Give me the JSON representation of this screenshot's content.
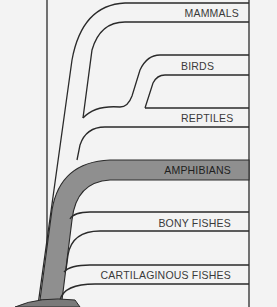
{
  "diagram": {
    "title": "",
    "type": "evolutionary-tree",
    "colors": {
      "background": "#f3f3f3",
      "line": "#2a2a2a",
      "highlight": "#8f8f8f",
      "text": "#3a3a3a"
    },
    "groups": [
      {
        "id": "mammals",
        "label": "MAMMALS"
      },
      {
        "id": "birds",
        "label": "BIRDS"
      },
      {
        "id": "reptiles",
        "label": "REPTILES"
      },
      {
        "id": "amphibians",
        "label": "AMPHIBIANS",
        "highlighted": true
      },
      {
        "id": "bony-fishes",
        "label": "BONY FISHES"
      },
      {
        "id": "cartilaginous-fishes",
        "label": "CARTILAGINOUS FISHES"
      }
    ]
  }
}
